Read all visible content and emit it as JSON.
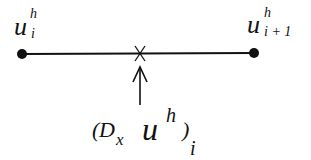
{
  "diagram": {
    "type": "finite-difference-stencil",
    "colors": {
      "ink": "#111111",
      "background": "#ffffff"
    },
    "nodes": [
      {
        "id": "left",
        "label_base": "u",
        "label_sup": "h",
        "label_sub": "i",
        "x": 22,
        "y": 54
      },
      {
        "id": "right",
        "label_base": "u",
        "label_sup": "h",
        "label_sub": "i + 1",
        "x": 254,
        "y": 53
      }
    ],
    "midpoint_marker": {
      "symbol": "x-cross",
      "x": 140,
      "y": 53
    },
    "arrow": {
      "direction": "up",
      "from_y": 105,
      "to_y": 66
    },
    "result_label": {
      "open_paren": "(",
      "operator": "D",
      "operator_sub": "x",
      "base": "u",
      "sup": "h",
      "close_paren": ")",
      "outer_sub": "i"
    }
  }
}
